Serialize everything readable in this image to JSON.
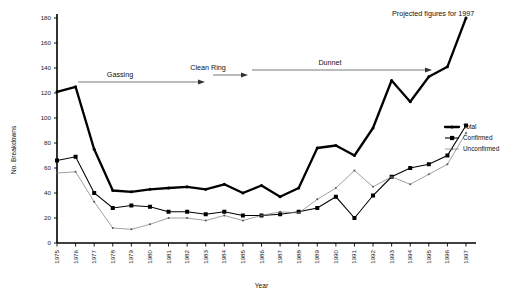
{
  "chart_data": {
    "type": "line",
    "title": "",
    "xlabel": "Year",
    "ylabel": "No. Breakdowns",
    "ylim": [
      0,
      180
    ],
    "ytick_step": 20,
    "yticks": [
      0,
      20,
      40,
      60,
      80,
      100,
      120,
      140,
      160,
      180
    ],
    "grid": false,
    "legend_position": "right",
    "categories": [
      "1975",
      "1976",
      "1977",
      "1978",
      "1979",
      "1980",
      "1981",
      "1982",
      "1983",
      "1984",
      "1985",
      "1986",
      "1987",
      "1988",
      "1989",
      "1990",
      "1991",
      "1992",
      "1993",
      "1994",
      "1995",
      "1996",
      "1997"
    ],
    "series": [
      {
        "name": "Total",
        "color": "#000000",
        "values": [
          121,
          125,
          75,
          42,
          41,
          43,
          44,
          45,
          43,
          47,
          40,
          46,
          37,
          44,
          76,
          78,
          70,
          92,
          130,
          113,
          133,
          141,
          180
        ]
      },
      {
        "name": "Confirmed",
        "color": "#000000",
        "values": [
          66,
          69,
          40,
          28,
          30,
          29,
          25,
          25,
          23,
          25,
          22,
          22,
          23,
          25,
          28,
          37,
          20,
          38,
          53,
          60,
          63,
          70,
          94
        ]
      },
      {
        "name": "Unconfirmed",
        "color": "#777777",
        "values": [
          56,
          57,
          33,
          12,
          11,
          15,
          20,
          20,
          18,
          22,
          18,
          22,
          25,
          24,
          35,
          44,
          58,
          45,
          53,
          47,
          55,
          63,
          88
        ]
      }
    ],
    "annotations": [
      {
        "id": "gassing",
        "label": "Gassing"
      },
      {
        "id": "clean-ring",
        "label": "Clean Ring"
      },
      {
        "id": "dunnet",
        "label": "Dunnet"
      },
      {
        "id": "projected",
        "label": "Projected figures for 1997"
      }
    ]
  },
  "legend": {
    "items": [
      {
        "label": "Total"
      },
      {
        "label": "Confirmed"
      },
      {
        "label": "Unconfirmed"
      }
    ]
  }
}
